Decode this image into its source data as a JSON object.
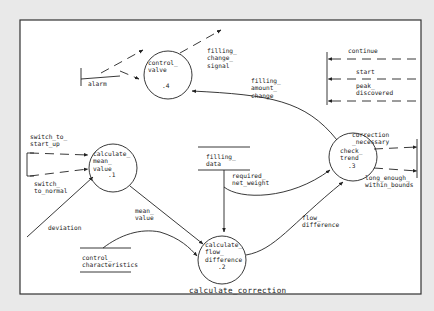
{
  "diagram": {
    "title": "calculate_correction",
    "processes": [
      {
        "id": "p1",
        "name": "calculate_\nmean_\nvalue",
        "number": ".1"
      },
      {
        "id": "p2",
        "name": "calculate_\nflow_\ndifference",
        "number": ".2"
      },
      {
        "id": "p3",
        "name": "check_\ntrend",
        "number": ".3"
      },
      {
        "id": "p4",
        "name": "control_\nvalve",
        "number": ".4"
      }
    ],
    "stores": [
      {
        "id": "s1",
        "name": "filling_\ndata"
      },
      {
        "id": "s2",
        "name": "control_\ncharacteristics"
      }
    ],
    "flows": {
      "alarm": "alarm",
      "filling_change_signal": "filling_\nchange_\nsignal",
      "filling_amount_change": "filling_\namount_\nchange",
      "continue": "continue",
      "start": "start",
      "peak_discovered": "peak_\ndiscovered",
      "switch_to_start_up": "switch_to_\nstart_up",
      "switch_to_normal": "switch_\nto_normal",
      "deviation": "deviation",
      "mean_value": "mean_\nvalue",
      "required_net_weight": "required_\nnet_weight",
      "flow_difference": "flow_\ndifference",
      "correction_necessary": "correction\n_necessary",
      "long_enough_within_bounds": "long_enough_\nwithin_bounds"
    },
    "colors": {
      "background": "#e9e9e9",
      "canvas": "#ffffff",
      "ink": "#222222"
    }
  }
}
